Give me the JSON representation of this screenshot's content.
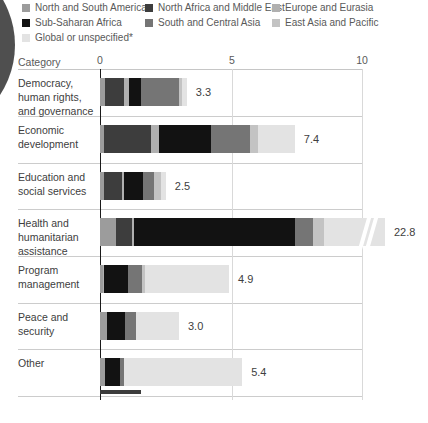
{
  "header": {
    "category_label": "Category",
    "tick_labels": [
      "0",
      "5",
      "10"
    ]
  },
  "legend": {
    "note_marker": "*"
  },
  "chart_data": {
    "type": "bar",
    "orientation": "horizontal",
    "stacked": true,
    "legend_position": "top",
    "x_ticks": [
      0,
      5,
      10
    ],
    "x_range_shown": [
      0,
      10
    ],
    "grid": "vertical-light",
    "regions": [
      {
        "name": "North and South America",
        "color": "#9c9c9c"
      },
      {
        "name": "North Africa and Middle East",
        "color": "#3d3d3d"
      },
      {
        "name": "Europe and Eurasia",
        "color": "#b0b0b0"
      },
      {
        "name": "Sub-Saharan Africa",
        "color": "#121212"
      },
      {
        "name": "South and Central Asia",
        "color": "#757575"
      },
      {
        "name": "East Asia and Pacific",
        "color": "#c3c3c3"
      },
      {
        "name": "Global or unspecified*",
        "color": "#e3e3e3"
      }
    ],
    "rows": [
      {
        "category": "Democracy, human rights, and governance",
        "lines": [
          "Democracy,",
          "human rights,",
          "and governance"
        ],
        "total_display": "3.3",
        "total": 3.3,
        "segments": [
          0.2,
          0.7,
          0.2,
          0.45,
          1.45,
          0.1,
          0.2
        ],
        "truncated": false
      },
      {
        "category": "Economic development",
        "lines": [
          "Economic",
          "development"
        ],
        "total_display": "7.4",
        "total": 7.4,
        "segments": [
          0.15,
          1.8,
          0.3,
          1.95,
          1.5,
          0.3,
          1.4
        ],
        "truncated": false
      },
      {
        "category": "Education and social services",
        "lines": [
          "Education and",
          "social services"
        ],
        "total_display": "2.5",
        "total": 2.5,
        "segments": [
          0.15,
          0.7,
          0.05,
          0.75,
          0.4,
          0.25,
          0.2
        ],
        "truncated": false
      },
      {
        "category": "Health and humanitarian assistance",
        "lines": [
          "Health and",
          "humanitarian",
          "assistance"
        ],
        "total_display": "22.8",
        "total": 22.8,
        "segments": [
          0.6,
          0.6,
          0.1,
          6.1,
          0.7,
          0.4,
          14.3
        ],
        "truncated": true
      },
      {
        "category": "Program management",
        "lines": [
          "Program",
          "management"
        ],
        "total_display": "4.9",
        "total": 4.9,
        "segments": [
          0.1,
          0,
          0.05,
          0.9,
          0.55,
          0.1,
          3.2
        ],
        "truncated": false
      },
      {
        "category": "Peace and security",
        "lines": [
          "Peace and",
          "security"
        ],
        "total_display": "3.0",
        "total": 3.0,
        "segments": [
          0.25,
          0,
          0,
          0.7,
          0.4,
          0,
          1.65
        ],
        "truncated": false
      },
      {
        "category": "Other",
        "lines": [
          "Other"
        ],
        "total_display": "5.4",
        "total": 5.4,
        "segments": [
          0.2,
          0,
          0,
          0.55,
          0.15,
          0,
          4.5
        ],
        "truncated": false
      }
    ]
  }
}
